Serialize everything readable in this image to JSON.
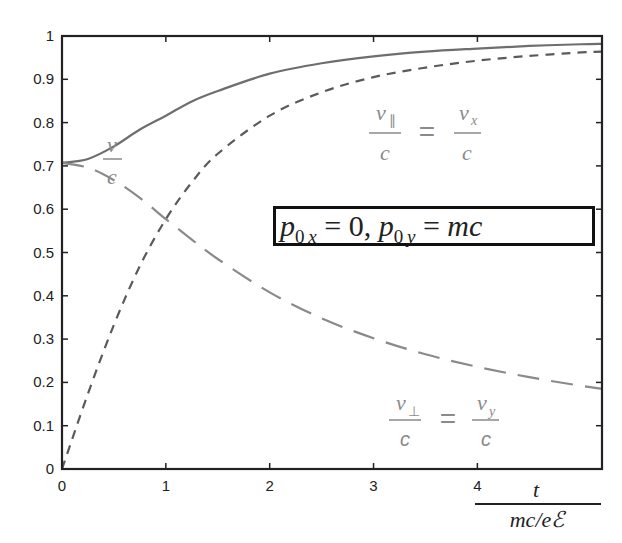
{
  "chart_data": {
    "type": "line",
    "title": "",
    "xlabel": "t / (mc/eE)",
    "xlabel_numerator": "t",
    "xlabel_denominator": "mc/eℰ",
    "ylabel": "",
    "xlim": [
      0,
      5.2
    ],
    "ylim": [
      0,
      1
    ],
    "grid": false,
    "x_ticks": [
      "0",
      "1",
      "2",
      "3",
      "4"
    ],
    "y_ticks": [
      "0",
      "0.1",
      "0.2",
      "0.3",
      "0.4",
      "0.5",
      "0.6",
      "0.7",
      "0.8",
      "0.9",
      "1"
    ],
    "x": [
      0,
      0.25,
      0.5,
      0.75,
      1,
      1.25,
      1.5,
      2,
      2.5,
      3,
      3.5,
      4,
      4.5,
      5,
      5.2
    ],
    "series": [
      {
        "name": "v/c",
        "style": "solid",
        "color": "#6e6e6e",
        "values": [
          0.707,
          0.716,
          0.745,
          0.784,
          0.816,
          0.849,
          0.873,
          0.913,
          0.937,
          0.953,
          0.964,
          0.971,
          0.977,
          0.981,
          0.982
        ]
      },
      {
        "name": "v_∥/c = v_x/c",
        "style": "short-dash",
        "color": "#5a5a5a",
        "values": [
          0.0,
          0.174,
          0.333,
          0.469,
          0.577,
          0.662,
          0.728,
          0.816,
          0.87,
          0.905,
          0.927,
          0.943,
          0.954,
          0.962,
          0.964
        ]
      },
      {
        "name": "v_⊥/c = v_y/c",
        "style": "long-dash",
        "color": "#8a8a8a",
        "values": [
          0.707,
          0.696,
          0.667,
          0.626,
          0.577,
          0.53,
          0.485,
          0.408,
          0.348,
          0.302,
          0.265,
          0.236,
          0.212,
          0.192,
          0.185
        ]
      }
    ],
    "annotations": [
      {
        "text": "v/c",
        "x": 0.55,
        "y": 0.85
      },
      {
        "text": "v_∥/c = v_x/c",
        "x": 3.1,
        "y": 0.82
      },
      {
        "text": "p_0x = 0, p_0y = mc",
        "x": 3.5,
        "y": 0.57,
        "boxed": true
      },
      {
        "text": "v_⊥/c = v_y/c",
        "x": 3.1,
        "y": 0.15
      }
    ],
    "legend": "none (inline annotations)"
  },
  "labels": {
    "v_over_c": {
      "num": "v",
      "den": "c"
    },
    "vpar": {
      "num1": "v",
      "sub1": "∥",
      "den1": "c",
      "eq": "=",
      "num2": "v",
      "sub2": "x",
      "den2": "c"
    },
    "vperp": {
      "num1": "v",
      "sub1": "⊥",
      "den1": "c",
      "eq": "=",
      "num2": "v",
      "sub2": "y",
      "den2": "c"
    },
    "initial": {
      "p1": "p",
      "s1a": "0",
      "s1b": "x",
      "eq1": " = 0, ",
      "p2": "p",
      "s2a": "0",
      "s2b": "y",
      "eq2": " = ",
      "mc": "mc"
    },
    "xaxis": {
      "num": "t",
      "den": "mc/eℰ"
    }
  }
}
